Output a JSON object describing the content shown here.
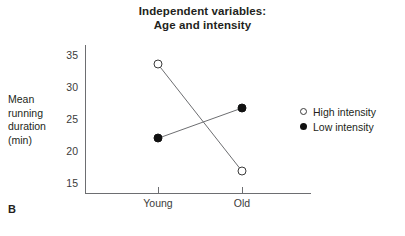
{
  "panel": {
    "label": "B"
  },
  "chart_data": {
    "type": "line",
    "title": "Independent variables:\nAge and intensity",
    "title_lines": [
      "Independent variables:",
      "Age and intensity"
    ],
    "xlabel": "",
    "ylabel": "Mean running duration (min)",
    "ylabel_lines": [
      "Mean",
      "running",
      "duration",
      "(min)"
    ],
    "categories": [
      "Young",
      "Old"
    ],
    "yticks": [
      35,
      30,
      25,
      20,
      15
    ],
    "ylim": [
      13.5,
      36.5
    ],
    "grid": false,
    "legend_position": "right",
    "series": [
      {
        "name": "High intensity",
        "marker": "open-circle",
        "color": "#3b3b3b",
        "values": [
          33.5,
          16.9
        ]
      },
      {
        "name": "Low intensity",
        "marker": "filled-circle",
        "color": "#111111",
        "values": [
          22.0,
          26.7
        ]
      }
    ]
  }
}
